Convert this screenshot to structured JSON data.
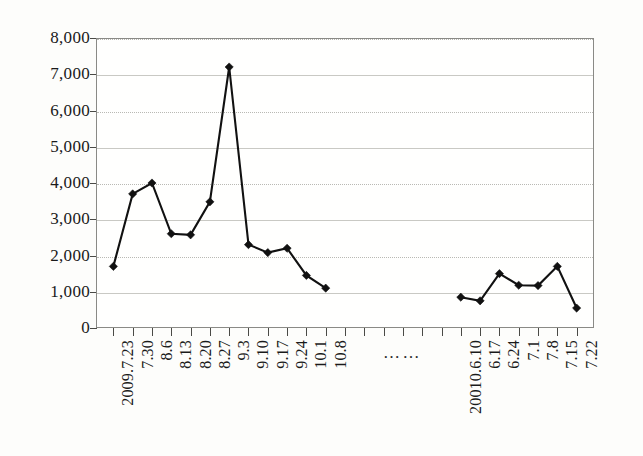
{
  "chart_data": {
    "type": "line",
    "title": "",
    "xlabel": "",
    "ylabel": "",
    "ylim": [
      0,
      8000
    ],
    "ytick_step": 1000,
    "ytick_labels": [
      "8,000",
      "7,000",
      "6,000",
      "5,000",
      "4,000",
      "3,000",
      "2,000",
      "1,000",
      "0"
    ],
    "ytick_values": [
      8000,
      7000,
      6000,
      5000,
      4000,
      3000,
      2000,
      1000,
      0
    ],
    "grid": true,
    "legend": null,
    "axis_break": {
      "symbol": "……",
      "note": "horizontal axis break between the 2009 segment and the 2010 segment"
    },
    "categories": [
      "2009.7.23",
      "7.30",
      "8.6",
      "8.13",
      "8.20",
      "8.27",
      "9.3",
      "9.10",
      "9.17",
      "9.24",
      "10.1",
      "10.8",
      "",
      "",
      "",
      "",
      "",
      "",
      "20010.6.10",
      "6.17",
      "6.24",
      "7.1",
      "7.8",
      "7.15",
      "7.22"
    ],
    "series": [
      {
        "name": "",
        "segments": [
          {
            "labels": [
              "2009.7.23",
              "7.30",
              "8.6",
              "8.13",
              "8.20",
              "8.27",
              "9.3",
              "9.10",
              "9.17",
              "9.24",
              "10.1",
              "10.8"
            ],
            "values": [
              1700,
              3700,
              4000,
              2600,
              2570,
              3480,
              7200,
              2300,
              2080,
              2200,
              1450,
              1100
            ]
          },
          {
            "labels": [
              "20010.6.10",
              "6.17",
              "6.24",
              "7.1",
              "7.8",
              "7.15",
              "7.22"
            ],
            "values": [
              850,
              750,
              1500,
              1180,
              1170,
              1700,
              550
            ]
          }
        ]
      }
    ],
    "colors": {
      "line": "#111111",
      "marker": "#111111",
      "grid": "#b9b9b4",
      "axis": "#8a8a86",
      "background": "#fffffe"
    }
  }
}
